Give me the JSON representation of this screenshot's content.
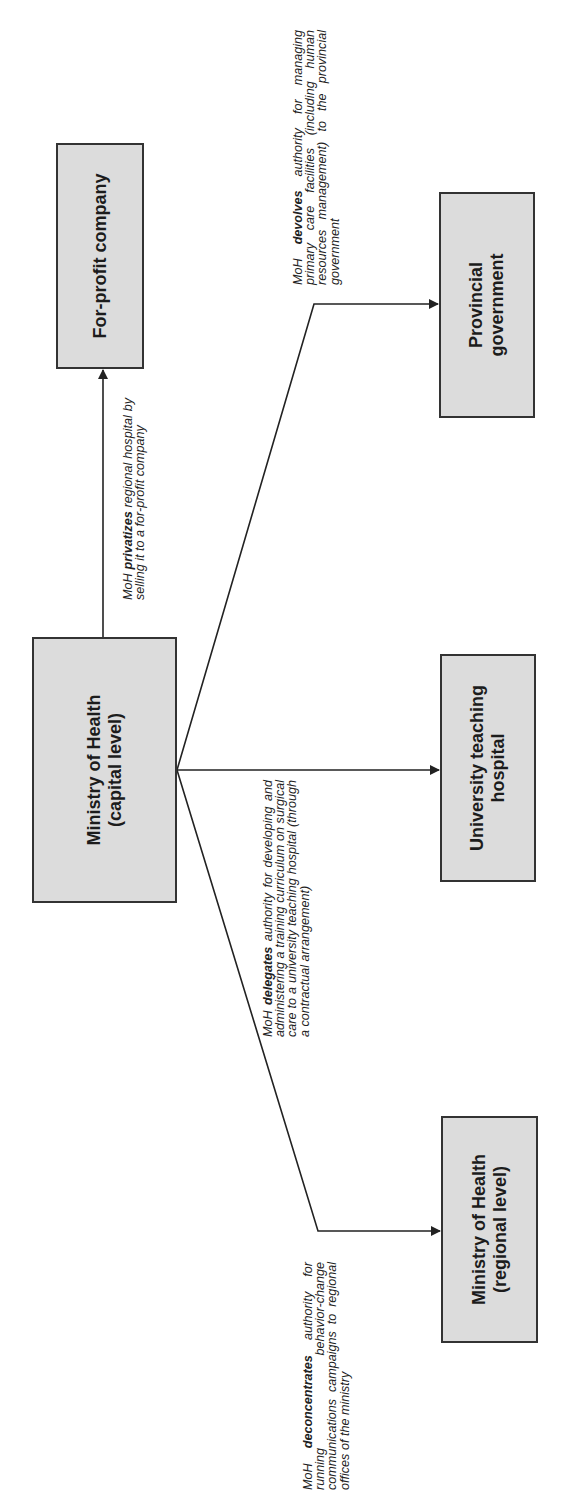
{
  "diagram": {
    "orientation": "rotated -90deg (reads bottom-to-top)",
    "nodes": {
      "capital": {
        "line1": "Ministry of Health",
        "line2": "(capital level)"
      },
      "for_profit": {
        "line1": "For-profit company"
      },
      "provincial": {
        "line1": "Provincial",
        "line2": "government"
      },
      "university": {
        "line1": "University teaching",
        "line2": "hospital"
      },
      "regional": {
        "line1": "Ministry of Health",
        "line2": "(regional level)"
      }
    },
    "edges": {
      "privatizes": {
        "prefix": "MoH ",
        "verb": "privatizes",
        "rest": " regional hospital by selling it to a for-profit company",
        "from": "capital",
        "to": "for_profit"
      },
      "devolves": {
        "prefix": "MoH ",
        "verb": "devolves",
        "rest": " authority for managing primary care facilities (including human resources management) to the provincial government",
        "from": "capital",
        "to": "provincial"
      },
      "delegates": {
        "prefix": "MoH ",
        "verb": "delegates",
        "rest": " authority for developing and administering a training curriculum on surgical care to a university teaching hospital (through a contractual arrangement)",
        "from": "capital",
        "to": "university"
      },
      "deconcentrates": {
        "prefix": "MoH ",
        "verb": "deconcentrates",
        "rest": " authority for running behavior-change communications campaigns to regional offices of the ministry",
        "from": "capital",
        "to": "regional"
      }
    },
    "colors": {
      "box_fill": "#dcdcdc",
      "box_border": "#333333",
      "line": "#222222",
      "background": "#ffffff"
    }
  }
}
